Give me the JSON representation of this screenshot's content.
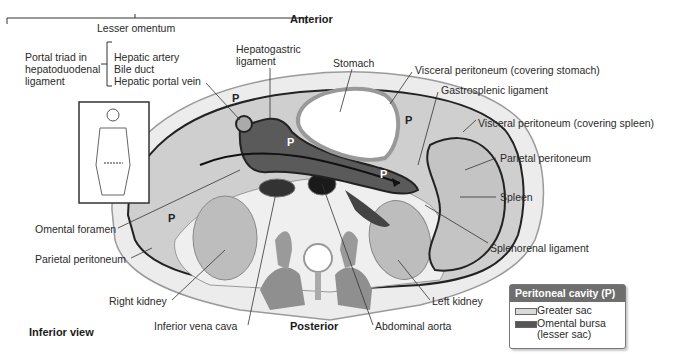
{
  "header": {
    "orientation_top": "Anterior",
    "orientation_bottom": "Posterior",
    "view": "Inferior view"
  },
  "labels": {
    "lesser_omentum": "Lesser omentum",
    "portal_triad": [
      "Portal triad in",
      "hepatoduodenal",
      "ligament"
    ],
    "portal_triad_items": [
      "Hepatic artery",
      "Bile duct",
      "Hepatic portal vein"
    ],
    "hepatogastric": [
      "Hepatogastric",
      "ligament"
    ],
    "stomach": "Stomach",
    "visceral_stomach": "Visceral peritoneum (covering stomach)",
    "gastrosplenic": "Gastrosplenic ligament",
    "visceral_spleen": "Visceral peritoneum (covering spleen)",
    "parietal_right": "Parietal peritoneum",
    "spleen": "Spleen",
    "splenorenal": "Splenorenal ligament",
    "left_kidney": "Left kidney",
    "abdominal_aorta": "Abdominal aorta",
    "inferior_vena_cava": "Inferior vena cava",
    "right_kidney": "Right kidney",
    "parietal_left": "Parietal peritoneum",
    "omental_foramen": "Omental foramen",
    "cavity_marker": "P"
  },
  "legend": {
    "title": "Peritoneal cavity (P)",
    "items": [
      {
        "label": "Greater sac",
        "color": "#d9d9d9"
      },
      {
        "label": "Omental bursa",
        "label2": "(lesser sac)",
        "color": "#555555"
      }
    ]
  },
  "colors": {
    "greater_sac": "#cfcfcf",
    "omental_bursa": "#5a5a5a",
    "muscle": "#8f8f8f",
    "body_wall": "#e8e8e8"
  }
}
